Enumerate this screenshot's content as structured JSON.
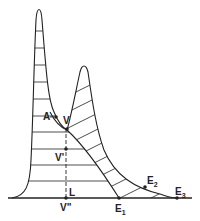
{
  "diagram": {
    "type": "overlapping peaks (chromatographic separation)",
    "labels": {
      "A": "A",
      "V": "V",
      "V_prime": "V'",
      "V_double_prime": "V\"",
      "L": "L",
      "E1": "E",
      "E1_sub": "1",
      "E2": "E",
      "E2_sub": "2",
      "E3": "E",
      "E3_sub": "3"
    },
    "colors": {
      "line": "#222222",
      "background": "#ffffff"
    }
  }
}
